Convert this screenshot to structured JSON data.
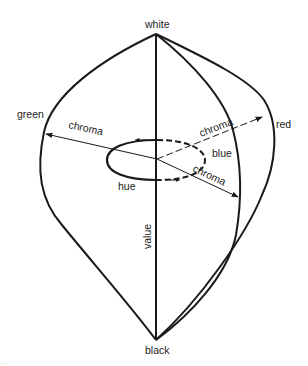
{
  "diagram": {
    "colors": {
      "stroke": "#1a1a1a",
      "text": "#222222",
      "background": "#ffffff"
    },
    "labels": {
      "top": "white",
      "bottom": "black",
      "left": "green",
      "right": "red",
      "inner": "blue",
      "axis": "value",
      "ring": "hue",
      "chroma_left": "chroma",
      "chroma_upper_right": "chroma",
      "chroma_lower_right": "chroma"
    },
    "footer_faint_text": "..."
  }
}
